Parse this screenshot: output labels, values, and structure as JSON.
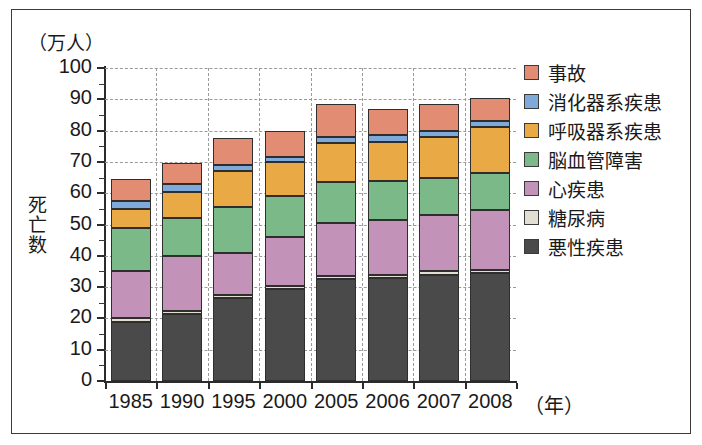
{
  "figure": {
    "unit_label": "（万人）",
    "y_axis_title": "死亡数",
    "x_unit_label": "（年）"
  },
  "chart_data": {
    "type": "bar",
    "stacked": true,
    "title": "",
    "xlabel": "（年）",
    "ylabel": "死亡数",
    "yunit": "（万人）",
    "ylim": [
      0,
      100
    ],
    "ytick_labels": [
      "100",
      "90",
      "80",
      "70",
      "60",
      "50",
      "40",
      "30",
      "20",
      "10",
      "0"
    ],
    "ytick_values": [
      100,
      90,
      80,
      70,
      60,
      50,
      40,
      30,
      20,
      10,
      0
    ],
    "grid": true,
    "legend_position": "right",
    "categories": [
      "1985",
      "1990",
      "1995",
      "2000",
      "2005",
      "2006",
      "2007",
      "2008"
    ],
    "series": [
      {
        "name": "悪性疾患",
        "color": "#4a4a4a",
        "values": [
          19.0,
          21.5,
          26.5,
          29.5,
          32.5,
          33.0,
          34.0,
          34.5
        ]
      },
      {
        "name": "糖尿病",
        "color": "#e2ded2",
        "values": [
          1.0,
          1.0,
          1.0,
          1.0,
          1.0,
          1.0,
          1.0,
          1.0
        ]
      },
      {
        "name": "心疾患",
        "color": "#c292b8",
        "values": [
          15.0,
          17.5,
          13.5,
          15.5,
          17.0,
          17.5,
          18.0,
          19.0
        ]
      },
      {
        "name": "脳血管障害",
        "color": "#7bb988",
        "values": [
          14.0,
          12.0,
          14.5,
          13.0,
          13.0,
          12.5,
          12.0,
          12.0
        ]
      },
      {
        "name": "呼吸器系疾患",
        "color": "#e9a945",
        "values": [
          6.0,
          8.5,
          11.5,
          11.0,
          12.5,
          12.5,
          13.0,
          14.5
        ]
      },
      {
        "name": "消化器系疾患",
        "color": "#7fa9d9",
        "values": [
          2.5,
          2.5,
          2.0,
          1.5,
          2.0,
          2.0,
          2.0,
          2.0
        ]
      },
      {
        "name": "事故",
        "color": "#e18c73",
        "values": [
          7.0,
          6.5,
          8.5,
          8.5,
          10.5,
          8.5,
          8.5,
          7.5
        ]
      }
    ],
    "totals": [
      64.5,
      69.5,
      77.5,
      80.0,
      88.5,
      87.0,
      88.5,
      90.5
    ]
  },
  "legend": {
    "items": [
      {
        "label": "事故",
        "color": "#e18c73"
      },
      {
        "label": "消化器系疾患",
        "color": "#7fa9d9"
      },
      {
        "label": "呼吸器系疾患",
        "color": "#e9a945"
      },
      {
        "label": "脳血管障害",
        "color": "#7bb988"
      },
      {
        "label": "心疾患",
        "color": "#c292b8"
      },
      {
        "label": "糖尿病",
        "color": "#e2ded2"
      },
      {
        "label": "悪性疾患",
        "color": "#4a4a4a"
      }
    ]
  }
}
